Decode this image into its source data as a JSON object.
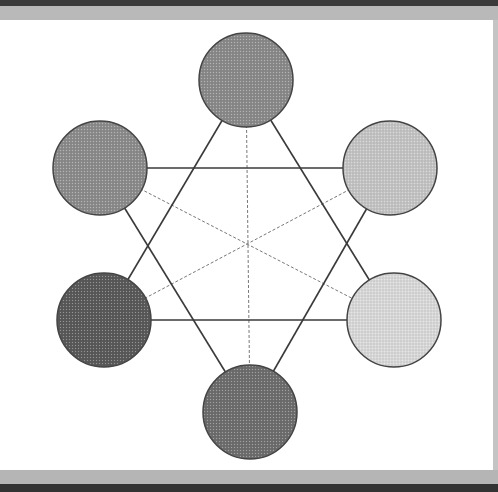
{
  "diagram": {
    "type": "hexagram-color-wheel",
    "nodes": [
      {
        "id": "top",
        "cx": 246,
        "cy": 80,
        "r": 47,
        "fill": "#8a8a8a"
      },
      {
        "id": "upper-right",
        "cx": 390,
        "cy": 168,
        "r": 47,
        "fill": "#c4c4c4"
      },
      {
        "id": "lower-right",
        "cx": 394,
        "cy": 320,
        "r": 47,
        "fill": "#d8d8d8"
      },
      {
        "id": "bottom",
        "cx": 250,
        "cy": 412,
        "r": 47,
        "fill": "#6e6e6e"
      },
      {
        "id": "lower-left",
        "cx": 104,
        "cy": 320,
        "r": 47,
        "fill": "#5a5a5a"
      },
      {
        "id": "upper-left",
        "cx": 100,
        "cy": 168,
        "r": 47,
        "fill": "#8c8c8c"
      }
    ],
    "solid_edges": [
      [
        "top",
        "lower-right"
      ],
      [
        "lower-right",
        "lower-left"
      ],
      [
        "lower-left",
        "top"
      ],
      [
        "bottom",
        "upper-right"
      ],
      [
        "upper-right",
        "upper-left"
      ],
      [
        "upper-left",
        "bottom"
      ]
    ],
    "dashed_edges": [
      [
        "top",
        "bottom"
      ],
      [
        "upper-left",
        "lower-right"
      ],
      [
        "upper-right",
        "lower-left"
      ]
    ],
    "colors": {
      "edge": "#3a3a3a",
      "dashed_edge": "#777777",
      "node_stroke": "#444444"
    }
  }
}
